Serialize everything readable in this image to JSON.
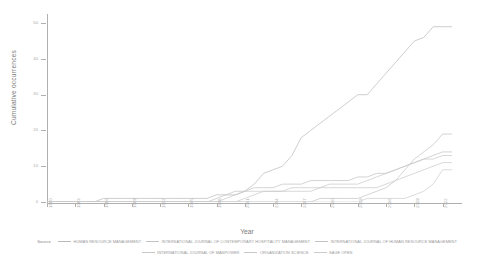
{
  "chart_data": {
    "type": "line",
    "title": "",
    "xlabel": "Year",
    "ylabel": "Cumulative occurrences",
    "xlim": [
      1980,
      2023
    ],
    "ylim": [
      0,
      52
    ],
    "yticks": [
      0,
      10,
      20,
      30,
      40,
      50
    ],
    "xticks": [
      1980,
      1983,
      1986,
      1989,
      1992,
      1995,
      1998,
      2001,
      2004,
      2007,
      2010,
      2013,
      2016,
      2019,
      2022
    ],
    "grid": false,
    "legend_position": "bottom",
    "legend_title": "Source",
    "x": [
      1980,
      1981,
      1982,
      1983,
      1984,
      1985,
      1986,
      1987,
      1988,
      1989,
      1990,
      1991,
      1992,
      1993,
      1994,
      1995,
      1996,
      1997,
      1998,
      1999,
      2000,
      2001,
      2002,
      2003,
      2004,
      2005,
      2006,
      2007,
      2008,
      2009,
      2010,
      2011,
      2012,
      2013,
      2014,
      2015,
      2016,
      2017,
      2018,
      2019,
      2020,
      2021,
      2022,
      2023
    ],
    "series": [
      {
        "name": "HUMAN RESOURCE MANAGEMENT",
        "color": "#b9b9b9",
        "values": [
          0,
          0,
          0,
          0,
          0,
          0,
          1,
          1,
          1,
          1,
          1,
          1,
          1,
          1,
          1,
          1,
          1,
          1,
          2,
          2,
          2,
          3,
          5,
          8,
          9,
          10,
          13,
          18,
          20,
          22,
          24,
          26,
          28,
          30,
          30,
          33,
          36,
          39,
          42,
          45,
          46,
          49,
          49,
          49
        ]
      },
      {
        "name": "INTERNATIONAL JOURNAL OF CONTEMPORARY HOSPITALITY MANAGEMENT",
        "color": "#c2c2c2",
        "values": [
          0,
          0,
          0,
          0,
          0,
          0,
          0,
          0,
          0,
          0,
          0,
          0,
          0,
          0,
          0,
          0,
          0,
          0,
          0,
          0,
          0,
          0,
          0,
          0,
          0,
          0,
          0,
          0,
          0,
          1,
          1,
          1,
          1,
          1,
          2,
          3,
          4,
          6,
          9,
          12,
          14,
          16,
          19,
          19
        ]
      },
      {
        "name": "INTERNATIONAL JOURNAL OF HUMAN RESOURCE MANAGEMENT",
        "color": "#c2c2c2",
        "values": [
          0,
          0,
          0,
          0,
          0,
          0,
          0,
          0,
          0,
          0,
          0,
          0,
          0,
          0,
          0,
          0,
          0,
          0,
          1,
          2,
          3,
          3,
          4,
          4,
          4,
          5,
          5,
          5,
          6,
          6,
          6,
          6,
          6,
          7,
          7,
          8,
          8,
          9,
          10,
          11,
          12,
          13,
          14,
          14
        ]
      },
      {
        "name": "INTERNATIONAL JOURNAL OF MANPOWER",
        "color": "#c7c7c7",
        "values": [
          0,
          0,
          0,
          0,
          0,
          0,
          0,
          0,
          0,
          0,
          0,
          0,
          0,
          0,
          0,
          0,
          0,
          0,
          0,
          1,
          2,
          3,
          3,
          3,
          3,
          3,
          4,
          4,
          4,
          4,
          5,
          5,
          5,
          5,
          6,
          7,
          8,
          9,
          10,
          11,
          12,
          12,
          13,
          13
        ]
      },
      {
        "name": "ORGANIZATION SCIENCE",
        "color": "#c7c7c7",
        "values": [
          0,
          0,
          0,
          0,
          0,
          0,
          0,
          0,
          0,
          0,
          0,
          0,
          0,
          0,
          0,
          0,
          0,
          0,
          0,
          0,
          0,
          1,
          2,
          3,
          3,
          3,
          3,
          3,
          3,
          4,
          4,
          4,
          4,
          4,
          4,
          4,
          5,
          6,
          7,
          8,
          9,
          10,
          11,
          11
        ]
      },
      {
        "name": "SAGE OPEN",
        "color": "#cccccc",
        "values": [
          0,
          0,
          0,
          0,
          0,
          0,
          0,
          0,
          0,
          0,
          0,
          0,
          0,
          0,
          0,
          0,
          0,
          0,
          0,
          0,
          0,
          0,
          0,
          0,
          0,
          0,
          0,
          0,
          0,
          0,
          0,
          0,
          0,
          0,
          1,
          1,
          1,
          1,
          1,
          2,
          3,
          5,
          9,
          9
        ]
      }
    ]
  }
}
